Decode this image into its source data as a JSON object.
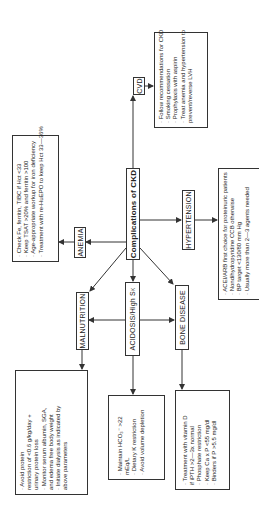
{
  "center": {
    "label": "Complications of CKD"
  },
  "nodes": {
    "cvd": {
      "label": "CVD",
      "items": [
        "· Follow recommendations for CKD",
        "· Smoking cessation",
        "· Prophylaxis with  aspirin",
        "· Treat anemia and hypertension to",
        "   prevent/reverse LVH"
      ]
    },
    "anemia": {
      "label": "ANEMIA",
      "items": [
        "· Check Fe, ferritin, TIBC if Hct <33",
        "· Keep TSAT >20% and ferritin >100",
        "· Age-appropriate workup for iron deficiency",
        "· Treatment with re-HuEPO to keep Hct 33—36%"
      ]
    },
    "hypertension": {
      "label": "HYPERTENSION",
      "items": [
        "· ACEI/ARB first choice for proteinuric patients",
        "· Nondihydropyridine CCB otherwise",
        "· BP target <130/80 mm Hg",
        "· Usually more than 2—3 agents needed"
      ]
    },
    "malnutrition": {
      "label": "MALNUTRITION",
      "items": [
        "· Avoid protein",
        "  restriction of <0.6 g/kg/day +",
        "  urinary protein loss",
        "· Monitor serum albumin, SGA,",
        "  and edema free body weight",
        "· Initiate dialysis as indicated by",
        "  above parameters"
      ]
    },
    "acidosis": {
      "label": "ACIDOSIS/High S",
      "label_sub": "K",
      "items": [
        "· Maintain HCO₃⁻  >22",
        "  mEq/L",
        "· Dietary K restriction",
        "· Avoid volume depletion"
      ]
    },
    "bone": {
      "label": "BONE DISEASE",
      "items": [
        "· Treatment with vitamin D",
        "  if iPTH >2—3x normal",
        "· Phosphate restriction",
        "· Keep Ca x P <55 mg/dl",
        "· Binders if P >5.5 mg/dl"
      ]
    }
  }
}
